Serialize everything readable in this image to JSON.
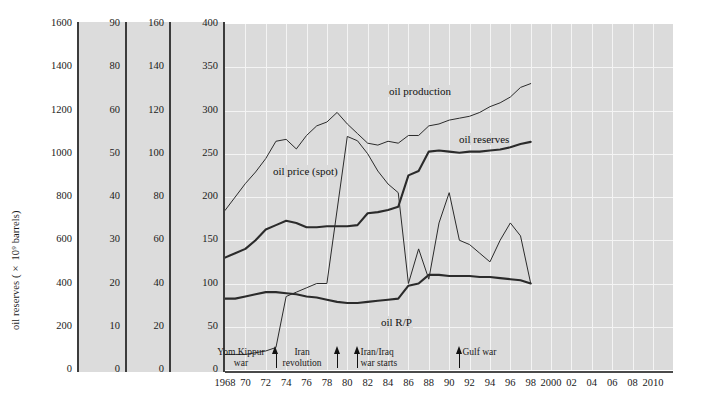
{
  "axes": {
    "y": [
      {
        "title": "oil reserves (× 10⁹ barrels)",
        "ticks": [
          "1600",
          "1400",
          "1200",
          "1000",
          "800",
          "600",
          "400",
          "200",
          "0"
        ]
      },
      {
        "title": "oil production ( × 10⁶ barrels per day)",
        "ticks": [
          "90",
          "80",
          "60",
          "50",
          "40",
          "30",
          "20",
          "10",
          "0"
        ]
      },
      {
        "title": "oil R/P ratio (world)",
        "ticks": [
          "160",
          "140",
          "120",
          "100",
          "80",
          "60",
          "40",
          "20",
          "0"
        ]
      },
      {
        "title": "oil price (US$ per tonne)",
        "ticks": [
          "400",
          "350",
          "300",
          "250",
          "200",
          "150",
          "100",
          "50",
          "0"
        ]
      }
    ],
    "x": {
      "labels": [
        "1968",
        "70",
        "72",
        "74",
        "76",
        "78",
        "80",
        "82",
        "84",
        "86",
        "88",
        "90",
        "92",
        "94",
        "96",
        "98",
        "2000",
        "02",
        "04",
        "06",
        "08",
        "2010"
      ],
      "min": 1968,
      "max": 2010
    }
  },
  "series_labels": {
    "production": "oil production",
    "reserves": "oil reserves",
    "price": "oil price (spot)",
    "rp": "oil R/P"
  },
  "annotations": [
    {
      "text": "Yom Kippur\nwar",
      "year": 1973,
      "align": "center"
    },
    {
      "text": "Iran\nrevolution",
      "year": 1979,
      "align": "center"
    },
    {
      "text": "Iran/Iraq\nwar starts",
      "year": 1981,
      "align": "left"
    },
    {
      "text": "Gulf war",
      "year": 1991,
      "align": "left"
    }
  ],
  "chart_data": {
    "type": "line",
    "title": "",
    "xlabel": "",
    "ylabel": "",
    "grid": true,
    "legend": "inline-labels",
    "xlim": [
      1968,
      2010
    ],
    "axis_ranges": {
      "oil_reserves": [
        0,
        1600
      ],
      "oil_production": [
        0,
        90
      ],
      "oil_rp_ratio": [
        0,
        160
      ],
      "oil_price": [
        0,
        400
      ]
    },
    "x": [
      1968,
      1969,
      1970,
      1971,
      1972,
      1973,
      1974,
      1975,
      1976,
      1977,
      1978,
      1979,
      1980,
      1981,
      1982,
      1983,
      1984,
      1985,
      1986,
      1987,
      1988,
      1989,
      1990,
      1991,
      1992,
      1993,
      1994,
      1995,
      1996,
      1997,
      1998
    ],
    "series": [
      {
        "name": "oil production",
        "axis": "oil_production",
        "unit": "× 10⁶ barrels per day",
        "style": "thin",
        "values": [
          41.5,
          45.0,
          48.5,
          51.5,
          55.0,
          59.5,
          60.0,
          57.5,
          61.0,
          63.5,
          64.5,
          67.0,
          64.0,
          61.5,
          59.0,
          58.5,
          59.5,
          59.0,
          61.0,
          61.0,
          63.5,
          64.0,
          65.0,
          65.5,
          66.0,
          67.0,
          68.5,
          69.5,
          71.0,
          73.5,
          74.5
        ]
      },
      {
        "name": "oil reserves",
        "axis": "oil_reserves",
        "unit": "× 10⁹ barrels",
        "style": "thick",
        "values": [
          520,
          540,
          560,
          600,
          650,
          670,
          690,
          680,
          660,
          660,
          665,
          665,
          665,
          670,
          725,
          730,
          740,
          755,
          900,
          920,
          1010,
          1015,
          1010,
          1005,
          1010,
          1010,
          1015,
          1020,
          1030,
          1045,
          1055
        ]
      },
      {
        "name": "oil price (spot)",
        "axis": "oil_price",
        "unit": "US$ per tonne",
        "style": "thin",
        "values": [
          18,
          18,
          18,
          20,
          22,
          26,
          85,
          90,
          95,
          100,
          100,
          185,
          270,
          265,
          250,
          230,
          215,
          205,
          100,
          140,
          105,
          170,
          205,
          150,
          145,
          135,
          125,
          150,
          170,
          155,
          100
        ]
      },
      {
        "name": "oil R/P",
        "axis": "oil_rp_ratio",
        "unit": "years",
        "style": "thick",
        "values": [
          33,
          33,
          34,
          35,
          36,
          36,
          35.5,
          35,
          34,
          33.5,
          32.5,
          31.5,
          31,
          31,
          31.5,
          32,
          32.5,
          33,
          39,
          40,
          44,
          44,
          43.5,
          43.5,
          43.5,
          43,
          43,
          42.5,
          42,
          41.5,
          40
        ]
      }
    ],
    "annotations": [
      {
        "label": "Yom Kippur war",
        "year": 1973
      },
      {
        "label": "Iran revolution",
        "year": 1979
      },
      {
        "label": "Iran/Iraq war starts",
        "year": 1981
      },
      {
        "label": "Gulf war",
        "year": 1991
      }
    ]
  }
}
